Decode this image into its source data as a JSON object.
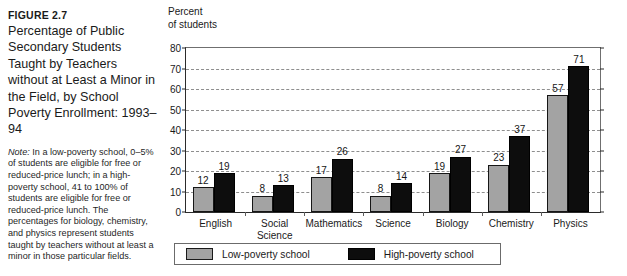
{
  "figure": {
    "label": "FIGURE 2.7",
    "title": "Percentage of Public Secondary Students Taught by Teachers without at Least a Minor in the Field, by School Poverty Enrollment: 1993–94",
    "note_lead": "Note:",
    "note_body": " In a low-poverty school, 0–5% of students are eligible for free or reduced-price lunch; in a high-poverty school, 41 to 100% of students are eligible for free or reduced-price lunch. The percentages for biology, chemistry, and physics represent students taught by teachers without at least a minor in those particular fields."
  },
  "axis_title": "Percent\nof students",
  "legend": {
    "items": [
      {
        "label": "Low-poverty school",
        "color": "#a3a3a3"
      },
      {
        "label": "High-poverty school",
        "color": "#0d0d0d"
      }
    ]
  },
  "chart_data": {
    "type": "bar",
    "title": "Percentage of Public Secondary Students Taught by Teachers without at Least a Minor in the Field, by School Poverty Enrollment: 1993–94",
    "xlabel": "",
    "ylabel": "Percent of students",
    "ylim": [
      0,
      80
    ],
    "yticks": [
      0,
      10,
      20,
      30,
      40,
      50,
      60,
      70,
      80
    ],
    "ytick_labels": [
      "0",
      "10",
      "20",
      "30",
      "40",
      "50",
      "60",
      "70",
      "80"
    ],
    "grid": "horizontal-dashed",
    "legend_position": "bottom-left",
    "categories": [
      "English",
      "Social\nScience",
      "Mathematics",
      "Science",
      "Biology",
      "Chemistry",
      "Physics"
    ],
    "category_labels": [
      "English",
      "Social Science",
      "Mathematics",
      "Science",
      "Biology",
      "Chemistry",
      "Physics"
    ],
    "series": [
      {
        "name": "Low-poverty school",
        "color": "#a3a3a3",
        "values": [
          12,
          8,
          17,
          8,
          19,
          23,
          57
        ]
      },
      {
        "name": "High-poverty school",
        "color": "#0d0d0d",
        "values": [
          19,
          13,
          26,
          14,
          27,
          37,
          71
        ]
      }
    ]
  }
}
